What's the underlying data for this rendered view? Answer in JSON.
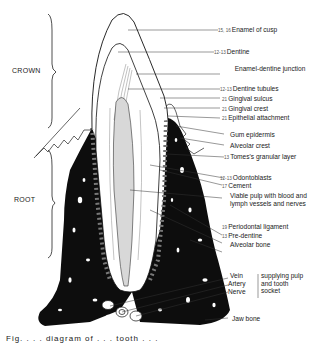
{
  "figure": {
    "side_labels": {
      "crown": "CROWN",
      "root": "ROOT"
    },
    "labels": [
      {
        "ref": "15, 16",
        "text": "Enamel of cusp"
      },
      {
        "ref": "12-13",
        "text": "Dentine"
      },
      {
        "ref": "",
        "text": "Enamel-dentine junction"
      },
      {
        "ref": "12-13",
        "text": "Dentine tubules"
      },
      {
        "ref": "21",
        "text": "Gingival sulcus"
      },
      {
        "ref": "21",
        "text": "Gingival crest"
      },
      {
        "ref": "21",
        "text": "Epithelial attachment"
      },
      {
        "ref": "",
        "text": "Gum epidermis"
      },
      {
        "ref": "",
        "text": "Alveolar crest"
      },
      {
        "ref": "13",
        "text": "Tomes's granular layer"
      },
      {
        "ref": "12-13",
        "text": "Odontoblasts"
      },
      {
        "ref": "17",
        "text": "Cement"
      },
      {
        "ref": "",
        "text": "Viable pulp with blood and lymph vessels and nerves"
      },
      {
        "ref": "19",
        "text": "Periodontal ligament"
      },
      {
        "ref": "13",
        "text": "Pre-dentine"
      },
      {
        "ref": "",
        "text": "Alveolar bone"
      }
    ],
    "vessels": {
      "items": [
        "Vein",
        "Artery",
        "Nerve"
      ],
      "note": "supplying pulp and tooth socket"
    },
    "jaw_bone": "Jaw bone",
    "caption_partial": "Fig. . . . diagram of . . . tooth . . ."
  }
}
